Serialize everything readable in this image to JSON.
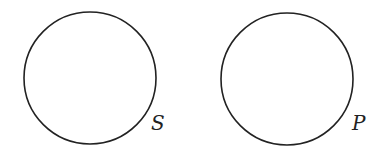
{
  "diagram": {
    "type": "venn-separate-sets",
    "stroke_color": "#222222",
    "sets": [
      {
        "label": "S",
        "cx": 90,
        "cy": 78,
        "r": 66
      },
      {
        "label": "P",
        "cx": 287,
        "cy": 79,
        "r": 66
      }
    ]
  }
}
